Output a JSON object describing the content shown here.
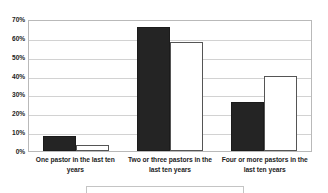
{
  "chart_data": {
    "type": "bar",
    "title": "",
    "xlabel": "",
    "ylabel": "",
    "ylim": [
      0,
      70
    ],
    "grid": true,
    "legend_position": "bottom",
    "categories": [
      "One pastor in the last ten years",
      "Two or three pastors in the last ten years",
      "Four or more pastors in the last ten years"
    ],
    "y_ticks": [
      "0%",
      "10%",
      "20%",
      "30%",
      "40%",
      "50%",
      "60%",
      "70%"
    ],
    "y_tick_values": [
      0,
      10,
      20,
      30,
      40,
      50,
      60,
      70
    ],
    "series": [
      {
        "name": "series-1",
        "color": "#242424",
        "values": [
          8,
          66,
          26
        ]
      },
      {
        "name": "series-2",
        "color": "#ffffff",
        "values": [
          3,
          58,
          40
        ]
      }
    ]
  },
  "colors": {
    "series_dark": "#242424",
    "series_light": "#ffffff",
    "gridline": "#d2d2d2",
    "axis": "#b9b9b9",
    "text": "#1d1d1d",
    "background": "#ffffff"
  }
}
